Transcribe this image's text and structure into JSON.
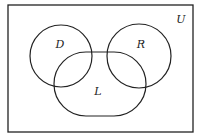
{
  "diagram": {
    "type": "venn",
    "universe": {
      "label": "U",
      "x": 8,
      "y": 5,
      "width": 185,
      "height": 127
    },
    "sets": [
      {
        "label": "D",
        "shape": "circle",
        "cx": 61,
        "cy": 56,
        "r": 31
      },
      {
        "label": "R",
        "shape": "circle",
        "cx": 139,
        "cy": 56,
        "r": 32
      },
      {
        "label": "L",
        "shape": "rounded-rect",
        "x": 54,
        "y": 52,
        "width": 92,
        "height": 64,
        "rx": 32
      }
    ],
    "stroke_color": "#222222",
    "background_color": "#ffffff"
  }
}
